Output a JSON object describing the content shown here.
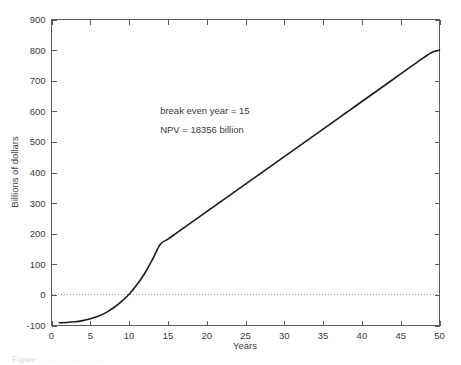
{
  "chart_data": {
    "type": "line",
    "title": "",
    "xlabel": "Years",
    "ylabel": "Billions of dollars",
    "xlim": [
      0,
      50
    ],
    "ylim": [
      -100,
      900
    ],
    "xticks": [
      0,
      5,
      10,
      15,
      20,
      25,
      30,
      35,
      40,
      45,
      50
    ],
    "xticklabels": [
      "0",
      "5",
      "10",
      "15",
      "20",
      "25",
      "30",
      "35",
      "40",
      "45",
      "50"
    ],
    "yticks": [
      -100,
      0,
      100,
      200,
      300,
      400,
      500,
      600,
      700,
      800,
      900
    ],
    "yticklabels": [
      "-100",
      "0",
      "100",
      "200",
      "300",
      "400",
      "500",
      "600",
      "700",
      "800",
      "900"
    ],
    "grid": false,
    "legend": null,
    "reference_lines": [
      {
        "name": "zero-line",
        "axis": "y",
        "value": 0,
        "style": "dotted",
        "color": "#9a9a9a"
      }
    ],
    "annotations": [
      {
        "name": "break-even-annotation",
        "text": "break even year = 15",
        "x": 14,
        "y": 590
      },
      {
        "name": "npv-annotation",
        "text": "NPV = 18356 billion",
        "x": 14,
        "y": 530
      }
    ],
    "series": [
      {
        "name": "cumulative-cash-flow",
        "color": "#1c1c1c",
        "x": [
          1,
          2,
          3,
          4,
          5,
          6,
          7,
          8,
          9,
          10,
          11,
          12,
          13,
          14,
          15,
          16,
          17,
          18,
          19,
          20,
          21,
          22,
          23,
          24,
          25,
          26,
          27,
          28,
          29,
          30,
          31,
          32,
          33,
          34,
          35,
          36,
          37,
          38,
          39,
          40,
          41,
          42,
          43,
          44,
          45,
          46,
          47,
          48,
          49,
          50
        ],
        "values": [
          -91,
          -90,
          -88,
          -84,
          -78,
          -70,
          -58,
          -42,
          -22,
          2,
          33,
          70,
          115,
          165,
          182,
          200,
          218,
          236,
          254,
          272,
          290,
          308,
          326,
          344,
          362,
          380,
          398,
          416,
          434,
          452,
          470,
          488,
          506,
          524,
          542,
          560,
          578,
          596,
          614,
          632,
          650,
          668,
          686,
          704,
          722,
          740,
          758,
          776,
          792,
          800
        ]
      }
    ]
  },
  "caption": {
    "text": "Figure . . . . . . . . . . . . . ."
  }
}
